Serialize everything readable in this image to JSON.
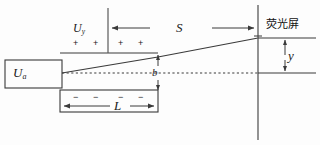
{
  "figure": {
    "background_color": "#fdfdfd",
    "line_color": "#3a3a3a",
    "text_color": "#1a1a1a"
  },
  "labels": {
    "accel_voltage": "U",
    "accel_voltage_sub": "a",
    "deflect_voltage": "U",
    "deflect_voltage_sub": "y",
    "screen_distance": "S",
    "plate_length": "L",
    "plate_gap": "b",
    "deflection": "y",
    "screen_name": "荧光屏"
  },
  "plate_signs": {
    "upper": [
      "+",
      "+",
      "+",
      "+"
    ],
    "lower": [
      "−",
      "−",
      "−",
      "−"
    ]
  },
  "geometry": {
    "source_box": {
      "x": 5,
      "y": 60,
      "w": 57,
      "h": 28
    },
    "upper_plate_line": {
      "x1": 60,
      "y1": 53,
      "x2": 158,
      "y2": 53
    },
    "lower_plate_box": {
      "x": 60,
      "y": 90,
      "w": 98,
      "h": 22
    },
    "axis_y": 73,
    "screen_x": 258,
    "beam_start": {
      "x": 62,
      "y": 73
    },
    "beam_exit": {
      "x": 158,
      "y": 57
    },
    "beam_hit": {
      "x": 258,
      "y": 38
    },
    "ref_line_x": 108,
    "ref_line_top": 8,
    "S_arrow_y": 28,
    "L_arrow_y": 106,
    "y_arrow_x": 285,
    "screen_top": 5,
    "screen_bottom": 140
  }
}
